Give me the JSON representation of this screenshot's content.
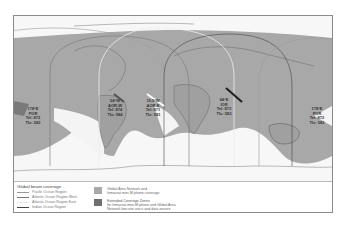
{
  "map": {
    "colors": {
      "ocean": "#f7f7f7",
      "global_area": "#a8a8a8",
      "extended_zone": "#7a7a7a",
      "coast": "#555555"
    },
    "satellites": [
      {
        "id": "por-left",
        "lines": [
          "178°E",
          "POR",
          "Tel: 872",
          "Tlx: 582"
        ]
      },
      {
        "id": "aor-w",
        "lines": [
          "54°W",
          "AOR-W",
          "Tel: 874",
          "Tlx: 584"
        ]
      },
      {
        "id": "aor-e",
        "lines": [
          "15.5°W",
          "AOR-E",
          "Tel: 871",
          "Tlx: 581"
        ]
      },
      {
        "id": "ior",
        "lines": [
          "64°E",
          "IOR",
          "Tel: 873",
          "Tlx: 583"
        ]
      },
      {
        "id": "por-right",
        "lines": [
          "178°E",
          "POR",
          "Tel: 872",
          "Tlx: 582"
        ]
      }
    ]
  },
  "legend": {
    "title": "Global beam coverage",
    "beams": [
      {
        "label": "Pacific Ocean Region",
        "color": "#9a9a9a"
      },
      {
        "label": "Atlantic Ocean Region West",
        "color": "#777777"
      },
      {
        "label": "Atlantic Ocean Region East",
        "color": "#e8e8e8"
      },
      {
        "label": "Indian Ocean Region",
        "color": "#444444"
      }
    ],
    "zones": [
      {
        "label_1": "Global Area Network and",
        "label_2": "Inmarsat mini-M phone coverage",
        "label_3": "",
        "color": "#a8a8a8"
      },
      {
        "label_1": "Extended Coverage Zones",
        "label_2": "for Inmarsat mini-M phone and Global Area",
        "label_3": "Network low rate voice and data service",
        "color": "#6f6f6f"
      }
    ]
  }
}
